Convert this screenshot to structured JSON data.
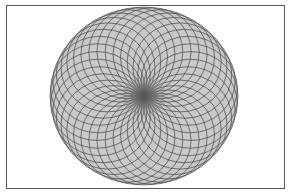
{
  "figure": {
    "type": "circle-of-circles spirograph",
    "circle_count": 36,
    "center": [
      144,
      96
    ],
    "outer_radius_x": 94,
    "outer_radius_y": 89,
    "colors": {
      "background": "#ffffff",
      "frame": "#555555",
      "fill": "#c9c9c9",
      "stroke": "#4f4f4f",
      "center_shade": "#6a6a6a"
    }
  }
}
